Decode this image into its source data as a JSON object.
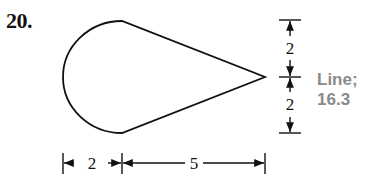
{
  "problem": {
    "number": "20."
  },
  "annotation": {
    "line1": "Line;",
    "line2": "16.3"
  },
  "dimensions": {
    "vertical_upper": "2",
    "vertical_lower": "2",
    "horizontal_left": "2",
    "horizontal_right": "5"
  },
  "colors": {
    "stroke": "#111111",
    "annotation": "#8a8a8a"
  }
}
